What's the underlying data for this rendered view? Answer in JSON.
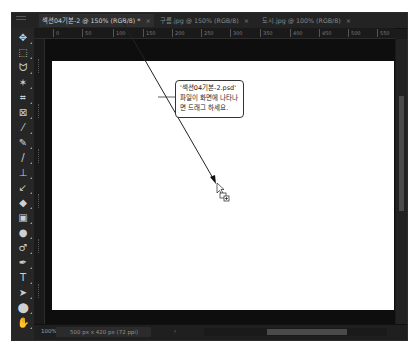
{
  "window": {
    "tabs": [
      {
        "label": "섹션04기본-2 @ 150% (RGB/8) *",
        "close": "×",
        "active": true
      },
      {
        "label": "구름.jpg @ 150% (RGB/8)",
        "close": "×",
        "active": false
      },
      {
        "label": "도시.jpg @ 100% (RGB/8)",
        "close": "×",
        "active": false
      }
    ]
  },
  "ruler": {
    "horizontal_ticks": [
      "0",
      "50",
      "100",
      "150",
      "200",
      "250",
      "300",
      "350",
      "400",
      "450",
      "500",
      "550"
    ]
  },
  "toolbar": {
    "tools": [
      {
        "name": "move-tool",
        "glyph": "✥"
      },
      {
        "name": "marquee-tool",
        "glyph": "⬚"
      },
      {
        "name": "lasso-tool",
        "glyph": "ᗢ"
      },
      {
        "name": "magic-wand-tool",
        "glyph": "✶"
      },
      {
        "name": "crop-tool",
        "glyph": "⌗"
      },
      {
        "name": "frame-tool",
        "glyph": "⊠"
      },
      {
        "name": "eyedropper-tool",
        "glyph": "⁄"
      },
      {
        "name": "healing-brush-tool",
        "glyph": "✎"
      },
      {
        "name": "brush-tool",
        "glyph": "/"
      },
      {
        "name": "clone-stamp-tool",
        "glyph": "⊥"
      },
      {
        "name": "history-brush-tool",
        "glyph": "↙"
      },
      {
        "name": "eraser-tool",
        "glyph": "◆"
      },
      {
        "name": "gradient-tool",
        "glyph": "▣"
      },
      {
        "name": "blur-tool",
        "glyph": "●"
      },
      {
        "name": "dodge-tool",
        "glyph": "♂"
      },
      {
        "name": "pen-tool",
        "glyph": "✒"
      },
      {
        "name": "type-tool",
        "glyph": "T"
      },
      {
        "name": "path-selection-tool",
        "glyph": "➤"
      },
      {
        "name": "shape-tool",
        "glyph": "⬤"
      },
      {
        "name": "hand-tool",
        "glyph": "✋"
      }
    ]
  },
  "status": {
    "zoom": "100%",
    "doc_info": "500 px x 420 px (72 ppi)",
    "arrow": "›"
  },
  "callout": {
    "lines": [
      "'섹션04기본-2.psd'",
      "파일이 화면에 나타나",
      "면 드래그 하세요."
    ]
  },
  "colors": {
    "ui_dark": "#1b1b1b",
    "canvas": "#ffffff",
    "annotation": "#222222"
  }
}
